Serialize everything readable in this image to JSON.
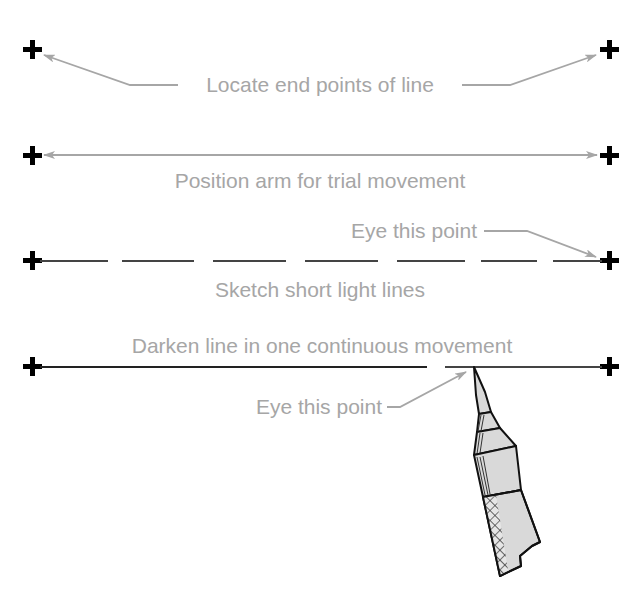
{
  "diagram": {
    "colors": {
      "background": "#ffffff",
      "label_text": "#a6a6a6",
      "leader_arrow": "#a6a6a6",
      "cross_marks": "#000000",
      "drawn_line": "#333333",
      "pencil_fill": "#d9d9d9",
      "pencil_outline": "#111111"
    },
    "steps": [
      {
        "step": 1,
        "label": "Locate end points of line",
        "line_style": "none",
        "annotation": "arrows from label to both end points"
      },
      {
        "step": 2,
        "label": "Position arm for trial movement",
        "line_style": "double-headed arrow between end points"
      },
      {
        "step": 3,
        "label": "Sketch short light lines",
        "line_style": "dashed",
        "callout": "Eye this point",
        "callout_target": "right end point"
      },
      {
        "step": 4,
        "label": "Darken line in one continuous movement",
        "line_style": "solid",
        "callout": "Eye this point",
        "callout_target": "pencil tip",
        "tool": "pencil"
      }
    ],
    "icons": [
      "plus-cross-icon",
      "arrow-icon",
      "pencil-icon"
    ]
  }
}
